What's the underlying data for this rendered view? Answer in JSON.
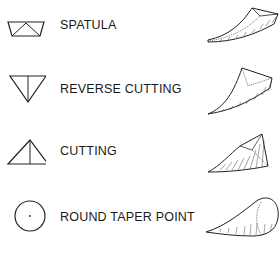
{
  "diagram": {
    "type": "needle-point-types",
    "items": [
      {
        "symbol": "spatula-cross-section-icon",
        "label": "SPATULA",
        "illustration": "spatula-needle-icon"
      },
      {
        "symbol": "reverse-cutting-cross-section-icon",
        "label": "REVERSE CUTTING",
        "illustration": "reverse-cutting-needle-icon"
      },
      {
        "symbol": "cutting-cross-section-icon",
        "label": "CUTTING",
        "illustration": "cutting-needle-icon"
      },
      {
        "symbol": "round-taper-point-cross-section-icon",
        "label": "ROUND TAPER POINT",
        "illustration": "round-taper-point-needle-icon"
      }
    ],
    "colors": {
      "line": "#222222",
      "background": "#ffffff"
    }
  }
}
